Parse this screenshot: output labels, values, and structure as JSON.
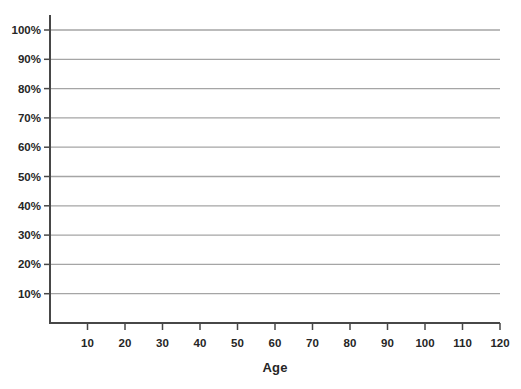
{
  "chart_data": {
    "type": "line",
    "title": "",
    "xlabel": "Age",
    "ylabel": "",
    "xlim": [
      0,
      120
    ],
    "ylim_percent": [
      0,
      100
    ],
    "grid": "horizontal",
    "legend": "none",
    "series": [],
    "x_ticks": [
      {
        "value": 10,
        "label": "10"
      },
      {
        "value": 20,
        "label": "20"
      },
      {
        "value": 30,
        "label": "30"
      },
      {
        "value": 40,
        "label": "40"
      },
      {
        "value": 50,
        "label": "50"
      },
      {
        "value": 60,
        "label": "60"
      },
      {
        "value": 70,
        "label": "70"
      },
      {
        "value": 80,
        "label": "80"
      },
      {
        "value": 90,
        "label": "90"
      },
      {
        "value": 100,
        "label": "100"
      },
      {
        "value": 110,
        "label": "110"
      },
      {
        "value": 120,
        "label": "120"
      }
    ],
    "y_ticks": [
      {
        "value": 10,
        "label": "10%"
      },
      {
        "value": 20,
        "label": "20%"
      },
      {
        "value": 30,
        "label": "30%"
      },
      {
        "value": 40,
        "label": "40%"
      },
      {
        "value": 50,
        "label": "50%"
      },
      {
        "value": 60,
        "label": "60%"
      },
      {
        "value": 70,
        "label": "70%"
      },
      {
        "value": 80,
        "label": "80%"
      },
      {
        "value": 90,
        "label": "90%"
      },
      {
        "value": 100,
        "label": "100%"
      }
    ]
  },
  "colors": {
    "background": "#ffffff",
    "gridline": "#a5a5a5",
    "axis": "#474747",
    "tick": "#474747",
    "label_text": "#262626"
  }
}
